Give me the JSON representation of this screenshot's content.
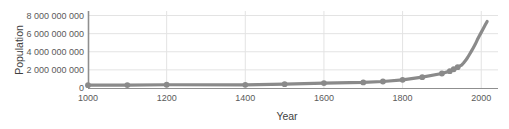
{
  "chart_data": {
    "type": "line",
    "title": "",
    "xlabel": "Year",
    "ylabel": "Population",
    "xlim": [
      1000,
      2035
    ],
    "ylim": [
      0,
      8500000000
    ],
    "grid": true,
    "legend": "none",
    "line_color": "#8a8a8a",
    "marker_color": "#8a8a8a",
    "axis_color": "#8f8f8f",
    "grid_color": "#e3e3e3",
    "text_color": "#5a5a5a",
    "xticks": [
      {
        "value": 1000,
        "label": "1000"
      },
      {
        "value": 1200,
        "label": "1200"
      },
      {
        "value": 1400,
        "label": "1400"
      },
      {
        "value": 1600,
        "label": "1600"
      },
      {
        "value": 1800,
        "label": "1800"
      },
      {
        "value": 2000,
        "label": "2000"
      }
    ],
    "yticks": [
      {
        "value": 0,
        "label": "0"
      },
      {
        "value": 2000000000,
        "label": "2 000 000 000"
      },
      {
        "value": 4000000000,
        "label": "4 000 000 000"
      },
      {
        "value": 6000000000,
        "label": "6 000 000 000"
      },
      {
        "value": 8000000000,
        "label": "8 000 000 000"
      }
    ],
    "x": [
      1000,
      1100,
      1200,
      1400,
      1500,
      1600,
      1700,
      1750,
      1800,
      1850,
      1900,
      1920,
      1930,
      1940,
      1950,
      1955,
      1960,
      1965,
      1970,
      1975,
      1980,
      1985,
      1990,
      1995,
      2000,
      2005,
      2010,
      2015
    ],
    "values": [
      310000000,
      320000000,
      360000000,
      350000000,
      425000000,
      545000000,
      610000000,
      720000000,
      900000000,
      1200000000,
      1600000000,
      1860000000,
      2070000000,
      2300000000,
      2525000000,
      2760000000,
      3030000000,
      3340000000,
      3700000000,
      4070000000,
      4450000000,
      4850000000,
      5320000000,
      5740000000,
      6140000000,
      6540000000,
      6960000000,
      7350000000
    ],
    "markers_x": [
      1000,
      1100,
      1200,
      1400,
      1500,
      1600,
      1700,
      1750,
      1800,
      1850,
      1900,
      1920,
      1930,
      1940
    ],
    "markers_values": [
      310000000,
      320000000,
      360000000,
      350000000,
      425000000,
      545000000,
      610000000,
      720000000,
      900000000,
      1200000000,
      1600000000,
      1860000000,
      2070000000,
      2300000000
    ]
  }
}
